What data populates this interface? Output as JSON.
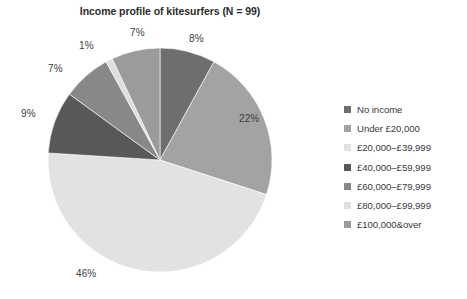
{
  "chart_data": {
    "type": "pie",
    "title": "Income profile of kitesurfers (N = 99)",
    "xlabel": "",
    "ylabel": "",
    "legend_position": "right",
    "grid": false,
    "categories": [
      "No income",
      "Under £20,000",
      "£20,000–£39,999",
      "£40,000–£59,999",
      "£60,000–£79,999",
      "£80,000–£99,999",
      "£100,000&over"
    ],
    "values": [
      8,
      22,
      46,
      9,
      7,
      1,
      7
    ],
    "value_labels": [
      "8%",
      "22%",
      "46%",
      "9%",
      "7%",
      "1%",
      "7%"
    ],
    "colors": [
      "#6e6e6e",
      "#a3a3a3",
      "#e2e2e2",
      "#585858",
      "#888888",
      "#dedede",
      "#9b9b9b"
    ],
    "start_angle_deg": 0,
    "direction": "clockwise",
    "units": "percent"
  },
  "chart": {
    "title": "Income profile of kitesurfers (N = 99)",
    "slice_labels": [
      {
        "text": "8%",
        "left": 189,
        "top": 33
      },
      {
        "text": "22%",
        "left": 239,
        "top": 113
      },
      {
        "text": "46%",
        "left": 76,
        "top": 268
      },
      {
        "text": "9%",
        "left": 21,
        "top": 108
      },
      {
        "text": "7%",
        "left": 48,
        "top": 63
      },
      {
        "text": "1%",
        "left": 79,
        "top": 40
      },
      {
        "text": "7%",
        "left": 130,
        "top": 27
      }
    ],
    "legend": {
      "items": [
        {
          "label": "No income",
          "color": "#6e6e6e"
        },
        {
          "label": "Under £20,000",
          "color": "#a3a3a3"
        },
        {
          "label": "£20,000–£39,999",
          "color": "#e2e2e2"
        },
        {
          "label": "£40,000–£59,999",
          "color": "#585858"
        },
        {
          "label": "£60,000–£79,999",
          "color": "#888888"
        },
        {
          "label": "£80,000–£99,999",
          "color": "#dedede"
        },
        {
          "label": "£100,000&over",
          "color": "#9b9b9b"
        }
      ]
    }
  }
}
